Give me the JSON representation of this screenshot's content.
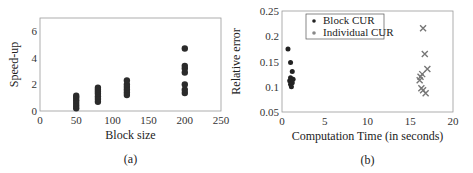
{
  "chart_data": [
    {
      "id": "a",
      "type": "scatter",
      "title": "",
      "caption": "(a)",
      "xlabel": "Block size",
      "ylabel": "Speed-up",
      "xlim": [
        0,
        250
      ],
      "ylim": [
        0,
        7
      ],
      "xticks": [
        0,
        50,
        100,
        150,
        200,
        250
      ],
      "yticks": [
        0,
        2,
        4,
        6
      ],
      "grid": false,
      "legend": null,
      "marker": "filled-circle",
      "color": "#2b2b2b",
      "series": [
        {
          "name": "Speed-up",
          "points": [
            [
              50,
              0.2
            ],
            [
              50,
              0.4
            ],
            [
              50,
              0.6
            ],
            [
              50,
              0.8
            ],
            [
              50,
              1.0
            ],
            [
              50,
              1.15
            ],
            [
              80,
              0.7
            ],
            [
              80,
              0.9
            ],
            [
              80,
              1.1
            ],
            [
              80,
              1.3
            ],
            [
              80,
              1.45
            ],
            [
              80,
              1.6
            ],
            [
              80,
              1.75
            ],
            [
              120,
              1.2
            ],
            [
              120,
              1.4
            ],
            [
              120,
              1.6
            ],
            [
              120,
              1.8
            ],
            [
              120,
              2.0
            ],
            [
              120,
              2.3
            ],
            [
              200,
              1.35
            ],
            [
              200,
              1.6
            ],
            [
              200,
              2.0
            ],
            [
              200,
              2.9
            ],
            [
              200,
              3.2
            ],
            [
              200,
              3.4
            ],
            [
              200,
              4.7
            ]
          ]
        }
      ]
    },
    {
      "id": "b",
      "type": "scatter",
      "title": "",
      "caption": "(b)",
      "xlabel": "Computation Time (in seconds)",
      "ylabel": "Relative error",
      "xlim": [
        0,
        20
      ],
      "ylim": [
        0.05,
        0.25
      ],
      "xticks": [
        0,
        5,
        10,
        15,
        20
      ],
      "yticks": [
        0.05,
        0.1,
        0.15,
        0.2,
        0.25
      ],
      "ytick_labels": [
        "0.05",
        "0.1",
        "0.15",
        "0.2",
        "0.25"
      ],
      "grid": false,
      "legend": {
        "position": "upper-left-center",
        "entries": [
          {
            "label": "Block CUR",
            "marker": "dot",
            "color": "#222222"
          },
          {
            "label": "Individual CUR",
            "marker": "dot",
            "color": "#888888"
          }
        ]
      },
      "series": [
        {
          "name": "Block CUR",
          "marker": "filled-circle",
          "color": "#222222",
          "points": [
            [
              0.7,
              0.175
            ],
            [
              1.0,
              0.148
            ],
            [
              1.2,
              0.13
            ],
            [
              1.0,
              0.118
            ],
            [
              1.3,
              0.115
            ],
            [
              0.9,
              0.112
            ],
            [
              1.2,
              0.108
            ],
            [
              1.0,
              0.105
            ],
            [
              1.1,
              0.1
            ]
          ]
        },
        {
          "name": "Individual CUR",
          "marker": "x",
          "color": "#777777",
          "points": [
            [
              16.5,
              0.216
            ],
            [
              16.7,
              0.165
            ],
            [
              17.0,
              0.135
            ],
            [
              16.4,
              0.125
            ],
            [
              16.2,
              0.12
            ],
            [
              16.1,
              0.113
            ],
            [
              16.3,
              0.097
            ],
            [
              16.5,
              0.093
            ],
            [
              16.8,
              0.087
            ]
          ]
        }
      ]
    }
  ]
}
